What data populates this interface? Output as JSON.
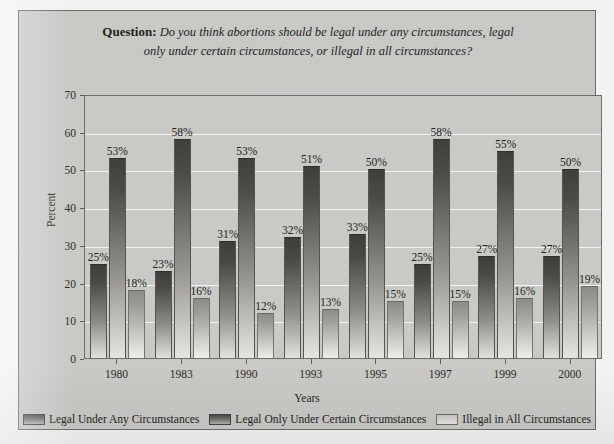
{
  "chart_data": {
    "type": "bar",
    "title": "Question: Do you think abortions should be legal under any circumstances, legal only under certain circumstances, or illegal in all circumstances?",
    "title_label": "Question:",
    "title_line1": "Do you think abortions should be legal under any circumstances, legal",
    "title_line2": "only under certain circumstances, or illegal in all circumstances?",
    "xlabel": "Years",
    "ylabel": "Percent",
    "categories": [
      "1980",
      "1983",
      "1990",
      "1993",
      "1995",
      "1997",
      "1999",
      "2000"
    ],
    "ylim": [
      0,
      70
    ],
    "yticks": [
      0,
      10,
      20,
      30,
      40,
      50,
      60,
      70
    ],
    "ytick_labels": [
      "0",
      "10",
      "20",
      "30",
      "40",
      "50",
      "60",
      "70"
    ],
    "grid": true,
    "legend_position": "bottom",
    "value_suffix": "%",
    "series": [
      {
        "name": "Legal Under Any Circumstances",
        "color": "#4a4946",
        "values": [
          25,
          23,
          31,
          32,
          33,
          25,
          27,
          27
        ],
        "labels": [
          "25%",
          "23%",
          "31%",
          "32%",
          "33%",
          "25%",
          "27%",
          "27%"
        ]
      },
      {
        "name": "Legal Only Under Certain Circumstances",
        "color": "#403f3c",
        "values": [
          53,
          58,
          53,
          51,
          50,
          58,
          55,
          50
        ],
        "labels": [
          "53%",
          "58%",
          "53%",
          "51%",
          "50%",
          "58%",
          "55%",
          "50%"
        ]
      },
      {
        "name": "Illegal in All Circumstances",
        "color": "#c2c1bc",
        "values": [
          18,
          16,
          12,
          13,
          15,
          15,
          16,
          19
        ],
        "labels": [
          "18%",
          "16%",
          "12%",
          "13%",
          "15%",
          "15%",
          "16%",
          "19%"
        ]
      }
    ]
  }
}
